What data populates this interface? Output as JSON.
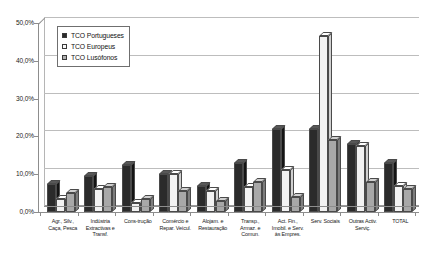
{
  "chart_data": {
    "type": "bar",
    "title": "",
    "xlabel": "",
    "ylabel": "",
    "ylim": [
      0,
      50
    ],
    "ytick_labels": [
      "0,0%",
      "10,0%",
      "20,0%",
      "30,0%",
      "40,0%",
      "50,0%"
    ],
    "ytick_values": [
      0,
      10,
      20,
      30,
      40,
      50
    ],
    "grid": true,
    "legend_position": "top-left",
    "categories": [
      "Agr., Silv., Caça, Pesca",
      "Indústria Extractivas e Transf.",
      "Cons-trução",
      "Comércio e Repar. Veícul.",
      "Alojam. e Restauração",
      "Transp., Armaz. e Comun.",
      "Act. Fin., Imobil. e Serv. às Empres.",
      "Serv. Sociais",
      "Outras Activ. Serviç.",
      "TOTAL"
    ],
    "category_lines": [
      [
        "Agr., Silv.,",
        "Caça, Pesca"
      ],
      [
        "Indústria",
        "Extractivas e",
        "Transf."
      ],
      [
        "Cons-trução"
      ],
      [
        "Comércio e",
        "Repar. Veícul."
      ],
      [
        "Alojam. e",
        "Restauração"
      ],
      [
        "Transp.,",
        "Armaz. e",
        "Comun."
      ],
      [
        "Act. Fin.,",
        "Imobil. e Serv.",
        "às Empres."
      ],
      [
        "Serv. Sociais"
      ],
      [
        "Outras Activ.",
        "Serviç."
      ],
      [
        "TOTAL"
      ]
    ],
    "series": [
      {
        "name": "TCO Portugueses",
        "color": "#2b2b2b",
        "values": [
          7.5,
          9.5,
          12.5,
          10.0,
          7.0,
          13.0,
          22.0,
          22.0,
          18.0,
          13.0
        ]
      },
      {
        "name": "TCO Europeus",
        "color": "#f2f2f2",
        "values": [
          3.5,
          6.0,
          2.5,
          10.0,
          5.5,
          6.5,
          11.0,
          46.5,
          17.5,
          7.0
        ]
      },
      {
        "name": "TCO Lusófonos",
        "color": "#a8a8a8",
        "values": [
          5.0,
          6.5,
          3.5,
          5.5,
          3.0,
          8.0,
          4.0,
          19.0,
          8.0,
          6.0
        ]
      }
    ]
  },
  "legend": {
    "items": [
      {
        "label": "TCO Portugueses",
        "swatch": "legend-swatch-dark"
      },
      {
        "label": "TCO Europeus",
        "swatch": "legend-swatch-white"
      },
      {
        "label": "TCO Lusófonos",
        "swatch": "legend-swatch-gray"
      }
    ]
  }
}
